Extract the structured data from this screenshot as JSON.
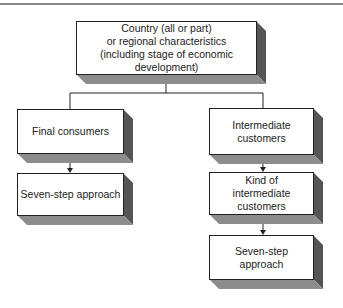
{
  "diagram": {
    "top": {
      "label": "Country (all or part)\nor regional characteristics\n(including stage of economic development)"
    },
    "left": [
      {
        "label": "Final consumers"
      },
      {
        "label": "Seven-step approach"
      }
    ],
    "right": [
      {
        "label": "Intermediate\ncustomers"
      },
      {
        "label": "Kind of\nintermediate customers"
      },
      {
        "label": "Seven-step\napproach"
      }
    ],
    "colors": {
      "face": "#ffffff",
      "side": "#555555",
      "bottom": "#8c8c8c",
      "line": "#222222"
    }
  }
}
